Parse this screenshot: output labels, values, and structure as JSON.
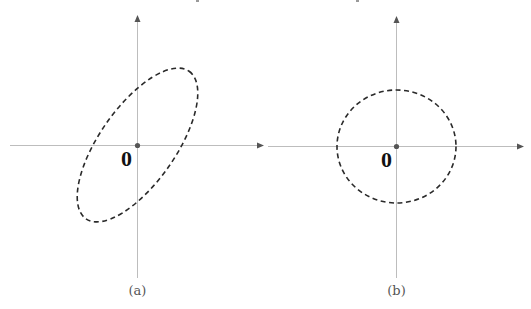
{
  "figure": {
    "panels": [
      {
        "id": "a",
        "caption": "(a)",
        "origin_label": "0",
        "shape": "rotated ellipse (dashed), tilted up-right",
        "colors": {
          "axis": "#bdbdbd",
          "curve": "#2a2a2a",
          "origin": "#555555"
        }
      },
      {
        "id": "b",
        "caption": "(b)",
        "origin_label": "0",
        "shape": "circle (dashed) centered at origin",
        "colors": {
          "axis": "#bdbdbd",
          "curve": "#2a2a2a",
          "origin": "#555555"
        }
      }
    ]
  }
}
